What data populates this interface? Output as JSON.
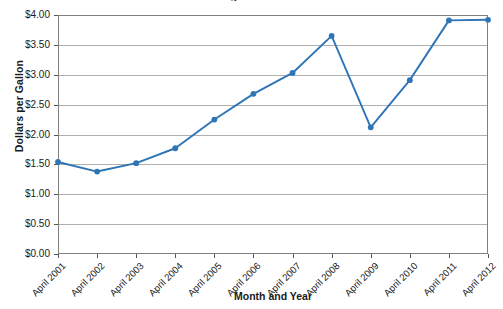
{
  "chart_data": {
    "type": "line",
    "title": "Average Gas Prices",
    "xlabel": "Month and Year",
    "ylabel": "Dollars per Gallon",
    "categories": [
      "April 2001",
      "April 2002",
      "April 2003",
      "April 2004",
      "April 2005",
      "April 2006",
      "April 2007",
      "April 2008",
      "April 2009",
      "April 2010",
      "April 2011",
      "April 2012"
    ],
    "values": [
      1.54,
      1.38,
      1.52,
      1.77,
      2.25,
      2.68,
      3.03,
      3.65,
      2.12,
      2.91,
      3.91,
      3.92
    ],
    "ylim": [
      0,
      4
    ],
    "ytick_values": [
      0,
      0.5,
      1,
      1.5,
      2,
      2.5,
      3,
      3.5,
      4
    ],
    "ytick_labels": [
      "$0.00",
      "$0.50",
      "$1.00",
      "$1.50",
      "$2.00",
      "$2.50",
      "$3.00",
      "$3.50",
      "$4.00"
    ],
    "grid": true,
    "legend": false,
    "series_color": "#2E75B6",
    "marker": "circle",
    "marker_color": "#2E75B6"
  },
  "axis": {
    "y_title": "Dollars per Gallon",
    "x_title": "Month and Year"
  },
  "title": "Average Gas Prices"
}
